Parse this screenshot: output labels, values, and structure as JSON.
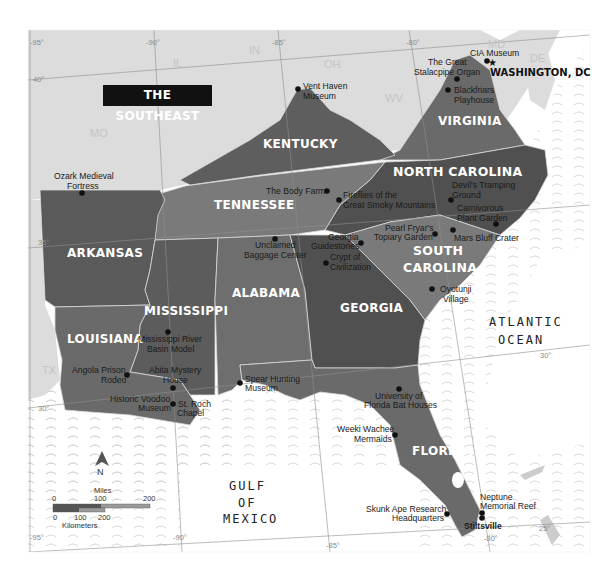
{
  "title": "THE SOUTHEAST",
  "colors": {
    "land_light": "#dcdcdc",
    "ocean": "#ffffff",
    "wave": "#d0d0d0",
    "state_dark": "#5a5a5a",
    "state_mid": "#6c6c6c",
    "state_light": "#7d7d7d",
    "border": "#d8d8d8",
    "grid": "#8f8f8f"
  },
  "neighbor_states": [
    "IL",
    "IN",
    "OH",
    "WV",
    "MD",
    "DE",
    "MO",
    "TX"
  ],
  "states": [
    {
      "name": "KENTUCKY",
      "label": "KENTUCKY"
    },
    {
      "name": "VIRGINIA",
      "label": "VIRGINIA"
    },
    {
      "name": "NORTH CAROLINA",
      "label": "NORTH CAROLINA"
    },
    {
      "name": "TENNESSEE",
      "label": "TENNESSEE"
    },
    {
      "name": "ARKANSAS",
      "label": "ARKANSAS"
    },
    {
      "name": "SOUTH CAROLINA",
      "label_line1": "SOUTH",
      "label_line2": "CAROLINA"
    },
    {
      "name": "MISSISSIPPI",
      "label": "MISSISSIPPI"
    },
    {
      "name": "ALABAMA",
      "label": "ALABAMA"
    },
    {
      "name": "GEORGIA",
      "label": "GEORGIA"
    },
    {
      "name": "LOUISIANA",
      "label": "LOUISIANA"
    },
    {
      "name": "FLORIDA",
      "label": "FLORIDA"
    }
  ],
  "capital": {
    "label": "WASHINGTON, DC"
  },
  "water_bodies": {
    "atlantic_line1": "ATLANTIC",
    "atlantic_line2": "OCEAN",
    "gulf_line1": "GULF",
    "gulf_line2": "OF",
    "gulf_line3": "MEXICO"
  },
  "grid_labels": {
    "lon_top": [
      "-95°",
      "-90°",
      "-85°",
      "-80°"
    ],
    "lon_bottom": [
      "-95°",
      "-90°",
      "-85°",
      "-80°"
    ],
    "lat": [
      "40°",
      "35°",
      "30°",
      "30°",
      "25°"
    ]
  },
  "points_of_interest": [
    {
      "name": "CIA Museum",
      "lines": [
        "CIA Museum"
      ]
    },
    {
      "name": "The Great Stalacpipe Organ",
      "lines": [
        "The Great",
        "Stalacpipe Organ"
      ]
    },
    {
      "name": "Blackfriars Playhouse",
      "lines": [
        "Blackfriars",
        "Playhouse"
      ]
    },
    {
      "name": "Vent Haven Museum",
      "lines": [
        "Vent Haven",
        "Museum"
      ]
    },
    {
      "name": "Ozark Medieval Fortress",
      "lines": [
        "Ozark Medieval",
        "Fortress"
      ]
    },
    {
      "name": "The Body Farm",
      "lines": [
        "The Body Farm"
      ]
    },
    {
      "name": "Fireflies of the Great Smoky Mountains",
      "lines": [
        "Fireflies of the",
        "Great Smoky Mountains"
      ]
    },
    {
      "name": "Devil's Tramping Ground",
      "lines": [
        "Devil's Tramping",
        "Ground"
      ]
    },
    {
      "name": "Carnivorous Plant Garden",
      "lines": [
        "Carnivorous",
        "Plant Garden"
      ]
    },
    {
      "name": "Pearl Fryar's Topiary Garden",
      "lines": [
        "Pearl Fryar's",
        "Topiary Garden"
      ]
    },
    {
      "name": "Mars Bluff Crater",
      "lines": [
        "Mars Bluff Crater"
      ]
    },
    {
      "name": "Georgia Guidestones",
      "lines": [
        "Georgia",
        "Guidestones"
      ]
    },
    {
      "name": "Unclaimed Baggage Center",
      "lines": [
        "Unclaimed",
        "Baggage Center"
      ]
    },
    {
      "name": "Crypt of Civilization",
      "lines": [
        "Crypt of",
        "Civilization"
      ]
    },
    {
      "name": "Oyotunji Village",
      "lines": [
        "Oyotunji",
        "Village"
      ]
    },
    {
      "name": "Mississippi River Basin Model",
      "lines": [
        "Mississippi River",
        "Basin Model"
      ]
    },
    {
      "name": "Angola Prison Rodeo",
      "lines": [
        "Angola Prison",
        "Rodeo"
      ]
    },
    {
      "name": "Abita Mystery House",
      "lines": [
        "Abita Mystery",
        "House"
      ]
    },
    {
      "name": "Historic Voodoo Museum",
      "lines": [
        "Historic Voodoo",
        "Museum"
      ]
    },
    {
      "name": "St. Roch Chapel",
      "lines": [
        "St. Roch",
        "Chapel"
      ]
    },
    {
      "name": "Spear Hunting Museum",
      "lines": [
        "Spear Hunting",
        "Museum"
      ]
    },
    {
      "name": "University of Florida Bat Houses",
      "lines": [
        "University of",
        "Florida Bat Houses"
      ]
    },
    {
      "name": "Weeki Wachee Mermaids",
      "lines": [
        "Weeki Wachee",
        "Mermaids"
      ]
    },
    {
      "name": "Skunk Ape Research Headquarters",
      "lines": [
        "Skunk Ape Research",
        "Headquarters"
      ]
    },
    {
      "name": "Neptune Memorial Reef",
      "lines": [
        "Neptune",
        "Memorial Reef"
      ]
    },
    {
      "name": "Stiltsville",
      "lines": [
        "Stiltsville"
      ]
    }
  ],
  "compass": {
    "label": "N"
  },
  "scale_bar": {
    "miles_label": "Miles",
    "miles_ticks": [
      "0",
      "100",
      "200"
    ],
    "km_label": "Kilometers",
    "km_ticks": [
      "0",
      "100",
      "200"
    ]
  }
}
